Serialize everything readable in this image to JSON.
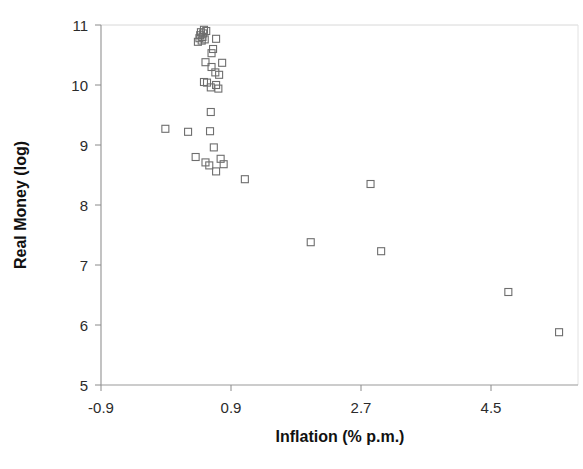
{
  "chart_data": {
    "type": "scatter",
    "title": "",
    "xlabel": "Inflation (% p.m.)",
    "ylabel": "Real Money (log)",
    "xlim": [
      -0.9,
      5.4
    ],
    "ylim": [
      5,
      11
    ],
    "xticks": [
      -0.9,
      0.9,
      2.7,
      4.5
    ],
    "xticklabels": [
      "-0.9",
      "0.9",
      "2.7",
      "4.5"
    ],
    "yticks": [
      5,
      6,
      7,
      8,
      9,
      10,
      11
    ],
    "yticklabels": [
      "5",
      "6",
      "7",
      "8",
      "9",
      "10",
      "11"
    ],
    "grid": false,
    "legend": null,
    "marker": {
      "shape": "open-square",
      "size": 7,
      "edge_color": "#6e6e6e",
      "face_color": "none"
    },
    "points": [
      {
        "x": 0.46,
        "y": 10.92
      },
      {
        "x": 0.49,
        "y": 10.9
      },
      {
        "x": 0.42,
        "y": 10.88
      },
      {
        "x": 0.45,
        "y": 10.86
      },
      {
        "x": 0.41,
        "y": 10.83
      },
      {
        "x": 0.44,
        "y": 10.8
      },
      {
        "x": 0.4,
        "y": 10.78
      },
      {
        "x": 0.47,
        "y": 10.76
      },
      {
        "x": 0.43,
        "y": 10.74
      },
      {
        "x": 0.38,
        "y": 10.72
      },
      {
        "x": 0.62,
        "y": 10.77
      },
      {
        "x": 0.58,
        "y": 10.6
      },
      {
        "x": 0.56,
        "y": 10.53
      },
      {
        "x": 0.48,
        "y": 10.38
      },
      {
        "x": 0.7,
        "y": 10.37
      },
      {
        "x": 0.56,
        "y": 10.3
      },
      {
        "x": 0.61,
        "y": 10.21
      },
      {
        "x": 0.66,
        "y": 10.17
      },
      {
        "x": 0.46,
        "y": 10.05
      },
      {
        "x": 0.5,
        "y": 10.04
      },
      {
        "x": 0.62,
        "y": 10.0
      },
      {
        "x": 0.65,
        "y": 9.94
      },
      {
        "x": 0.55,
        "y": 9.96
      },
      {
        "x": -0.05,
        "y": 9.27
      },
      {
        "x": 0.55,
        "y": 9.55
      },
      {
        "x": 0.25,
        "y": 9.22
      },
      {
        "x": 0.54,
        "y": 9.23
      },
      {
        "x": 0.59,
        "y": 8.96
      },
      {
        "x": 0.35,
        "y": 8.8
      },
      {
        "x": 0.48,
        "y": 8.71
      },
      {
        "x": 0.53,
        "y": 8.66
      },
      {
        "x": 0.68,
        "y": 8.77
      },
      {
        "x": 0.72,
        "y": 8.68
      },
      {
        "x": 0.62,
        "y": 8.56
      },
      {
        "x": 1.0,
        "y": 8.43
      },
      {
        "x": 2.66,
        "y": 8.35
      },
      {
        "x": 1.87,
        "y": 7.38
      },
      {
        "x": 2.8,
        "y": 7.23
      },
      {
        "x": 4.48,
        "y": 6.55
      },
      {
        "x": 5.15,
        "y": 5.88
      }
    ]
  },
  "axes": {
    "plot_area": {
      "left": 101,
      "top": 25,
      "right": 578,
      "bottom": 385
    },
    "frame_color": "#cfcfcf",
    "axis_color": "#8a8a8a",
    "background": "#ffffff"
  }
}
